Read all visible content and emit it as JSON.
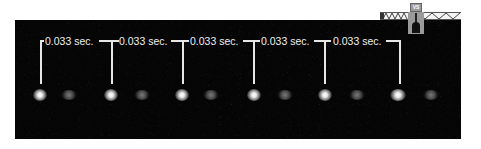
{
  "figure": {
    "interval_label": "0.033 sec.",
    "intervals": [
      {
        "label": "0.033 sec."
      },
      {
        "label": "0.033 sec."
      },
      {
        "label": "0.033 sec."
      },
      {
        "label": "0.033 sec."
      },
      {
        "label": "0.033 sec."
      }
    ],
    "bright_spot_count": 6,
    "dim_spot_count": 6
  },
  "inset": {
    "box_label": "VS"
  },
  "colors": {
    "background": "#050505",
    "annotation": "#e6e6e6",
    "inset_gray": "#9a9a9a"
  }
}
